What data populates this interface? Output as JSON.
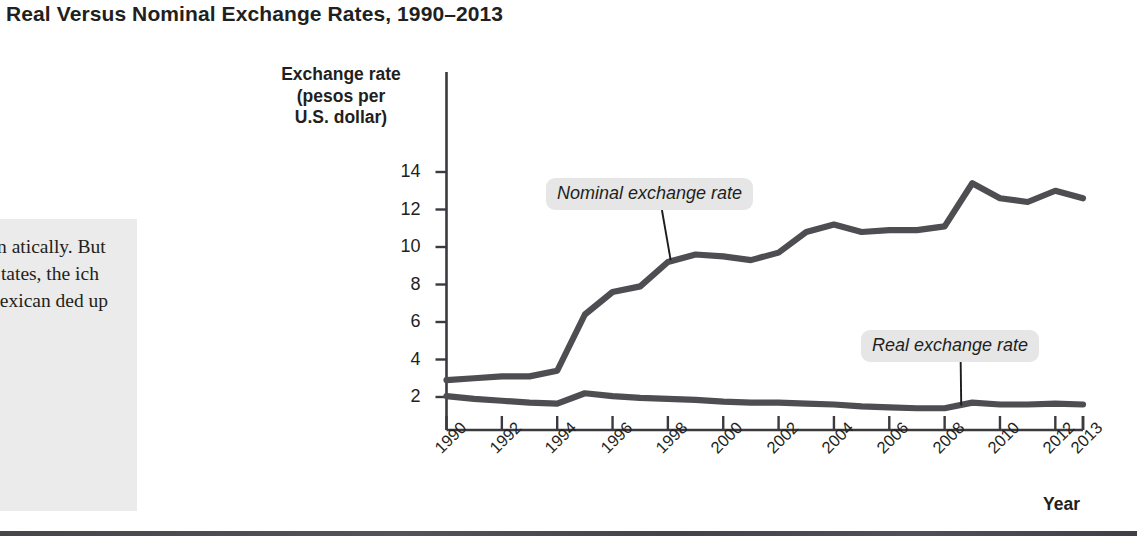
{
  "figure": {
    "title": "Real Versus Nominal Exchange Rates, 1990–2013"
  },
  "caption": {
    "text": "13, the exican atically. But igher infla- States, the ich accounts f Mexican ded up ed."
  },
  "chart_data": {
    "type": "line",
    "title": "Real Versus Nominal Exchange Rates, 1990–2013",
    "xlabel": "Year",
    "ylabel": "Exchange rate (pesos per U.S. dollar)",
    "ylabel_lines": [
      "Exchange rate",
      "(pesos per",
      "U.S. dollar)"
    ],
    "xlim": [
      1990,
      2013
    ],
    "ylim": [
      0,
      15
    ],
    "yticks": [
      2,
      4,
      6,
      8,
      10,
      12,
      14
    ],
    "ytick_labels": [
      "2",
      "4",
      "6",
      "8",
      "10",
      "12",
      "14"
    ],
    "xticks": [
      1990,
      1992,
      1994,
      1996,
      1998,
      2000,
      2002,
      2004,
      2006,
      2008,
      2010,
      2012,
      2013
    ],
    "xtick_labels": [
      "1990",
      "1992",
      "1994",
      "1996",
      "1998",
      "2000",
      "2002",
      "2004",
      "2006",
      "2008",
      "2010",
      "2012",
      "2013"
    ],
    "grid": false,
    "legend_position": "inline-annotations",
    "line_color": "#4d4d52",
    "x": [
      1990,
      1991,
      1992,
      1993,
      1994,
      1995,
      1996,
      1997,
      1998,
      1999,
      2000,
      2001,
      2002,
      2003,
      2004,
      2005,
      2006,
      2007,
      2008,
      2009,
      2010,
      2011,
      2012,
      2013
    ],
    "series": [
      {
        "name": "Nominal exchange rate",
        "values": [
          2.9,
          3.0,
          3.1,
          3.1,
          3.4,
          6.4,
          7.6,
          7.9,
          9.2,
          9.6,
          9.5,
          9.3,
          9.7,
          10.8,
          11.2,
          10.8,
          10.9,
          10.9,
          11.1,
          13.4,
          12.6,
          12.4,
          13.0,
          12.6
        ]
      },
      {
        "name": "Real exchange rate",
        "values": [
          2.05,
          1.9,
          1.8,
          1.7,
          1.65,
          2.2,
          2.05,
          1.95,
          1.9,
          1.85,
          1.75,
          1.7,
          1.7,
          1.65,
          1.6,
          1.5,
          1.45,
          1.4,
          1.4,
          1.7,
          1.6,
          1.6,
          1.65,
          1.6
        ]
      }
    ],
    "annotations": [
      {
        "label": "Nominal exchange rate",
        "target_x": 1998.1,
        "target_y": 9.3
      },
      {
        "label": "Real exchange rate",
        "target_x": 2008.6,
        "target_y": 1.55
      }
    ]
  }
}
